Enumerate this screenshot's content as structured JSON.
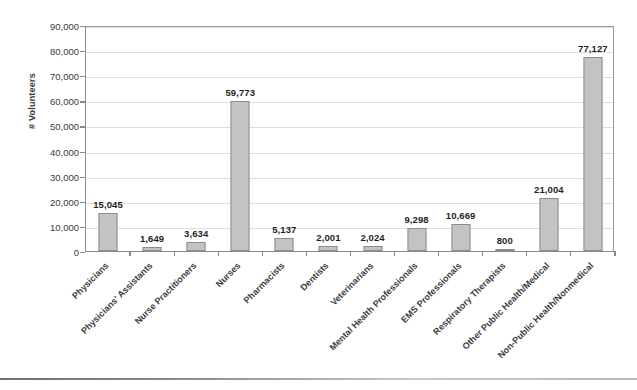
{
  "chart_data": {
    "type": "bar",
    "title": "",
    "subtitle": "",
    "xlabel": "",
    "ylabel": "# Volunteers",
    "ylim": [
      0,
      90000
    ],
    "ytick_step": 10000,
    "yticks": [
      "0",
      "10,000",
      "20,000",
      "30,000",
      "40,000",
      "50,000",
      "60,000",
      "70,000",
      "80,000",
      "90,000"
    ],
    "ytick_values": [
      0,
      10000,
      20000,
      30000,
      40000,
      50000,
      60000,
      70000,
      80000,
      90000
    ],
    "grid": "horizontal",
    "legend": "none",
    "categories": [
      "Physicians",
      "Physicians' Assistants",
      "Nurse Practitioners",
      "Nurses",
      "Pharmacists",
      "Dentists",
      "Veterinarians",
      "Mental Health Professionals",
      "EMS Professionals",
      "Respiratory Therapists",
      "Other Public Health/Medical",
      "Non-Public Health/Nonmedical"
    ],
    "values": [
      15045,
      1649,
      3634,
      59773,
      5137,
      2001,
      2024,
      9298,
      10669,
      800,
      21004,
      77127
    ],
    "value_labels": [
      "15,045",
      "1,649",
      "3,634",
      "59,773",
      "5,137",
      "2,001",
      "2,024",
      "9,298",
      "10,669",
      "800",
      "21,004",
      "77,127"
    ],
    "bar_color": "#c3c3c3",
    "bar_border_color": "#8d8d8d",
    "gridline_color": "#dedede",
    "axis_color": "#8a8a8a"
  }
}
